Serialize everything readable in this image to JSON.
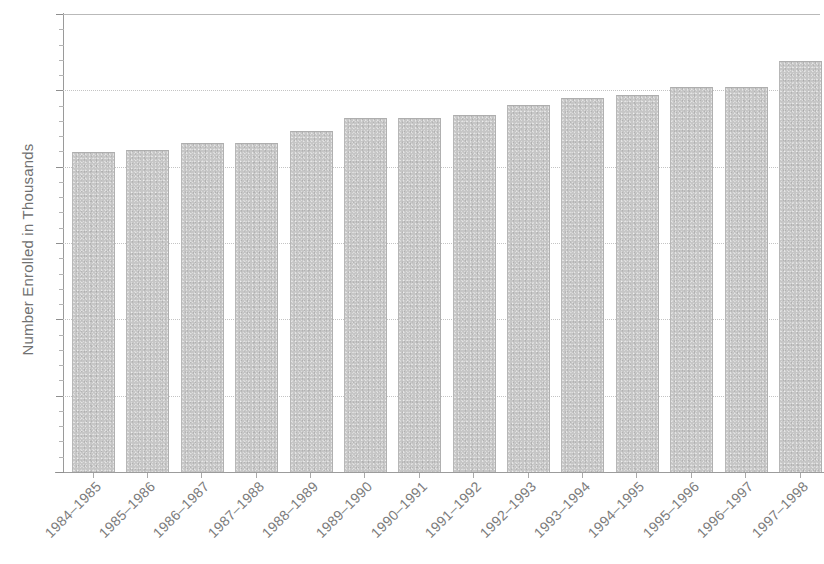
{
  "chart_data": {
    "type": "bar",
    "title": "",
    "xlabel": "",
    "ylabel": "Number Enrolled in Thousands",
    "ylim": [
      0,
      6
    ],
    "yticks": [
      0,
      1,
      2,
      3,
      4,
      5,
      6
    ],
    "ytick_labels": [
      "0",
      "1",
      "2",
      "3",
      "4",
      "5",
      "6"
    ],
    "grid": "horizontal-dotted",
    "legend": "none",
    "bar_color": "#c6c6c6",
    "categories": [
      "1984–1985",
      "1985–1986",
      "1986–1987",
      "1987–1988",
      "1988–1989",
      "1989–1990",
      "1990–1991",
      "1991–1992",
      "1992–1993",
      "1993–1994",
      "1994–1995",
      "1995–1996",
      "1996–1997",
      "1997–1998"
    ],
    "values": [
      4.18,
      4.2,
      4.3,
      4.3,
      4.46,
      4.63,
      4.63,
      4.67,
      4.8,
      4.89,
      4.93,
      5.03,
      5.03,
      5.37
    ]
  }
}
